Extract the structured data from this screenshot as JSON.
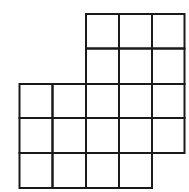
{
  "figure": {
    "type": "polyomino-grid",
    "columns": 5,
    "rows": 5,
    "cell_count": 19,
    "line_color": "#1a1a1a",
    "background": "#ffffff",
    "cells": [
      [
        0,
        2
      ],
      [
        0,
        3
      ],
      [
        0,
        4
      ],
      [
        1,
        2
      ],
      [
        1,
        3
      ],
      [
        1,
        4
      ],
      [
        2,
        0
      ],
      [
        2,
        1
      ],
      [
        2,
        2
      ],
      [
        2,
        3
      ],
      [
        2,
        4
      ],
      [
        3,
        0
      ],
      [
        3,
        1
      ],
      [
        3,
        2
      ],
      [
        3,
        3
      ],
      [
        3,
        4
      ],
      [
        4,
        0
      ],
      [
        4,
        1
      ],
      [
        4,
        2
      ],
      [
        4,
        3
      ]
    ]
  }
}
